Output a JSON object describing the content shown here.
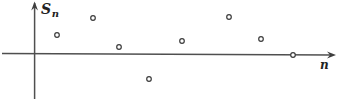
{
  "figure": {
    "background": "#ffffff",
    "axis_line_color": "#4f4f4f",
    "marker_stroke_color": "#3c3c3c",
    "marker_fill_color": "#ffffff"
  },
  "chart_data": {
    "type": "scatter",
    "title": "",
    "ylabel": "Sn",
    "ylabel_main": "S",
    "ylabel_sub": "n",
    "xlabel": "n",
    "legend": "none",
    "grid": false,
    "axes": {
      "ticks": "none",
      "x_axis": {
        "x1": 2,
        "y1": 53.4,
        "x2": 333,
        "y2": 55
      },
      "y_axis": {
        "x": 34.6,
        "y_top": 3,
        "y_bottom": 99
      }
    },
    "marker": {
      "shape": "open-circle",
      "radius_px": 2.3
    },
    "points": [
      {
        "n": 1,
        "x_px": 57,
        "y_px": 35,
        "s_offset_from_axis_px": 19.5
      },
      {
        "n": 2,
        "x_px": 93,
        "y_px": 18,
        "s_offset_from_axis_px": 36.5
      },
      {
        "n": 3,
        "x_px": 119,
        "y_px": 47,
        "s_offset_from_axis_px": 7.5
      },
      {
        "n": 4,
        "x_px": 149,
        "y_px": 79,
        "s_offset_from_axis_px": -24.5
      },
      {
        "n": 5,
        "x_px": 182,
        "y_px": 41,
        "s_offset_from_axis_px": 13.5
      },
      {
        "n": 6,
        "x_px": 229,
        "y_px": 17,
        "s_offset_from_axis_px": 37.5
      },
      {
        "n": 7,
        "x_px": 261,
        "y_px": 39,
        "s_offset_from_axis_px": 15.5
      },
      {
        "n": 8,
        "x_px": 293,
        "y_px": 55,
        "s_offset_from_axis_px": -0.5
      }
    ]
  }
}
